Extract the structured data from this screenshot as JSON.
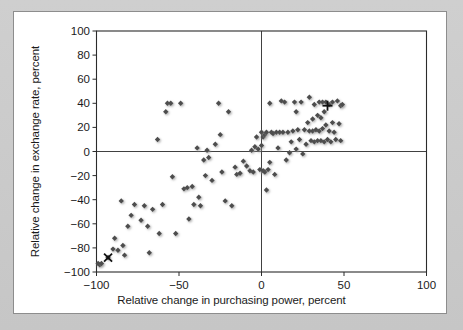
{
  "chart_data": {
    "type": "scatter",
    "title": "",
    "xlabel": "Relative change in purchasing power, percent",
    "ylabel": "Relative change in exchange rate, percent",
    "xlim": [
      -100,
      100
    ],
    "ylim": [
      -100,
      100
    ],
    "xticks": [
      -100,
      -50,
      0,
      50,
      100
    ],
    "yticks": [
      -100,
      -80,
      -60,
      -40,
      -20,
      0,
      20,
      40,
      60,
      80,
      100
    ],
    "xtick_labels": [
      "−100",
      "−50",
      "0",
      "50",
      "100"
    ],
    "ytick_labels": [
      "−100",
      "−80",
      "−60",
      "−40",
      "−20",
      "0",
      "20",
      "40",
      "60",
      "80",
      "100"
    ],
    "grid": false,
    "legend": null,
    "reference_lines": [
      {
        "axis": "y",
        "value": 0
      },
      {
        "axis": "x",
        "value": 0
      }
    ],
    "marker_color": "#4d4d4d",
    "series": [
      {
        "name": "countries",
        "marker": "diamond",
        "points": [
          [
            -99,
            -93
          ],
          [
            -98,
            -94
          ],
          [
            -97,
            -93
          ],
          [
            -93,
            -88
          ],
          [
            -90,
            -81
          ],
          [
            -89,
            -72
          ],
          [
            -87,
            -82
          ],
          [
            -85,
            -41
          ],
          [
            -84,
            -78
          ],
          [
            -83,
            -86
          ],
          [
            -81,
            -62
          ],
          [
            -79,
            -53
          ],
          [
            -77,
            -44
          ],
          [
            -73,
            -57
          ],
          [
            -71,
            -45
          ],
          [
            -69,
            -62
          ],
          [
            -68,
            -84
          ],
          [
            -66,
            -48
          ],
          [
            -63,
            10
          ],
          [
            -62,
            -68
          ],
          [
            -60,
            -44
          ],
          [
            -58,
            33
          ],
          [
            -57,
            40
          ],
          [
            -55,
            40
          ],
          [
            -54,
            -21
          ],
          [
            -52,
            -68
          ],
          [
            -49,
            40
          ],
          [
            -47,
            -31
          ],
          [
            -45,
            -30
          ],
          [
            -44,
            -56
          ],
          [
            -42,
            -29
          ],
          [
            -41,
            -44
          ],
          [
            -39,
            3
          ],
          [
            -38,
            -38
          ],
          [
            -37,
            -45
          ],
          [
            -35,
            -7
          ],
          [
            -34,
            -20
          ],
          [
            -33,
            1
          ],
          [
            -32,
            -5
          ],
          [
            -30,
            -24
          ],
          [
            -28,
            6
          ],
          [
            -26,
            40
          ],
          [
            -25,
            14
          ],
          [
            -24,
            -17
          ],
          [
            -22,
            -41
          ],
          [
            -20,
            33
          ],
          [
            -18,
            -45
          ],
          [
            -16,
            -13
          ],
          [
            -15,
            -19
          ],
          [
            -13,
            -18
          ],
          [
            -11,
            -8
          ],
          [
            -9,
            -12
          ],
          [
            -7,
            -16
          ],
          [
            -6,
            1
          ],
          [
            -5,
            -17
          ],
          [
            -4,
            4
          ],
          [
            -3,
            12
          ],
          [
            -2,
            2
          ],
          [
            -1,
            -15
          ],
          [
            0,
            5
          ],
          [
            0,
            16
          ],
          [
            1,
            -16
          ],
          [
            1,
            12
          ],
          [
            2,
            -17
          ],
          [
            2,
            14
          ],
          [
            3,
            16
          ],
          [
            3,
            -32
          ],
          [
            4,
            -15
          ],
          [
            5,
            40
          ],
          [
            5,
            -9
          ],
          [
            6,
            16
          ],
          [
            7,
            15
          ],
          [
            8,
            -19
          ],
          [
            9,
            16
          ],
          [
            10,
            3
          ],
          [
            11,
            16
          ],
          [
            12,
            42
          ],
          [
            13,
            16
          ],
          [
            14,
            41
          ],
          [
            15,
            -7
          ],
          [
            16,
            16
          ],
          [
            17,
            -1
          ],
          [
            18,
            8
          ],
          [
            19,
            17
          ],
          [
            20,
            41
          ],
          [
            21,
            33
          ],
          [
            21,
            2
          ],
          [
            22,
            18
          ],
          [
            23,
            10
          ],
          [
            24,
            41
          ],
          [
            25,
            -2
          ],
          [
            26,
            18
          ],
          [
            27,
            6
          ],
          [
            28,
            24
          ],
          [
            29,
            45
          ],
          [
            29,
            17
          ],
          [
            30,
            9
          ],
          [
            31,
            27
          ],
          [
            31,
            17
          ],
          [
            32,
            39
          ],
          [
            32,
            8
          ],
          [
            33,
            18
          ],
          [
            34,
            30
          ],
          [
            34,
            9
          ],
          [
            35,
            41
          ],
          [
            35,
            17
          ],
          [
            36,
            28
          ],
          [
            36,
            9
          ],
          [
            37,
            41
          ],
          [
            37,
            19
          ],
          [
            38,
            33
          ],
          [
            38,
            8
          ],
          [
            39,
            41
          ],
          [
            39,
            22
          ],
          [
            40,
            10
          ],
          [
            41,
            39
          ],
          [
            41,
            17
          ],
          [
            42,
            8
          ],
          [
            43,
            24
          ],
          [
            43,
            41
          ],
          [
            44,
            16
          ],
          [
            45,
            10
          ],
          [
            46,
            42
          ],
          [
            47,
            23
          ],
          [
            48,
            38
          ],
          [
            48,
            9
          ],
          [
            49,
            39
          ]
        ]
      },
      {
        "name": "marker-x",
        "marker": "x",
        "points": [
          [
            -93,
            -88
          ]
        ]
      },
      {
        "name": "marker-plus",
        "marker": "plus",
        "points": [
          [
            40,
            38
          ]
        ]
      }
    ]
  }
}
